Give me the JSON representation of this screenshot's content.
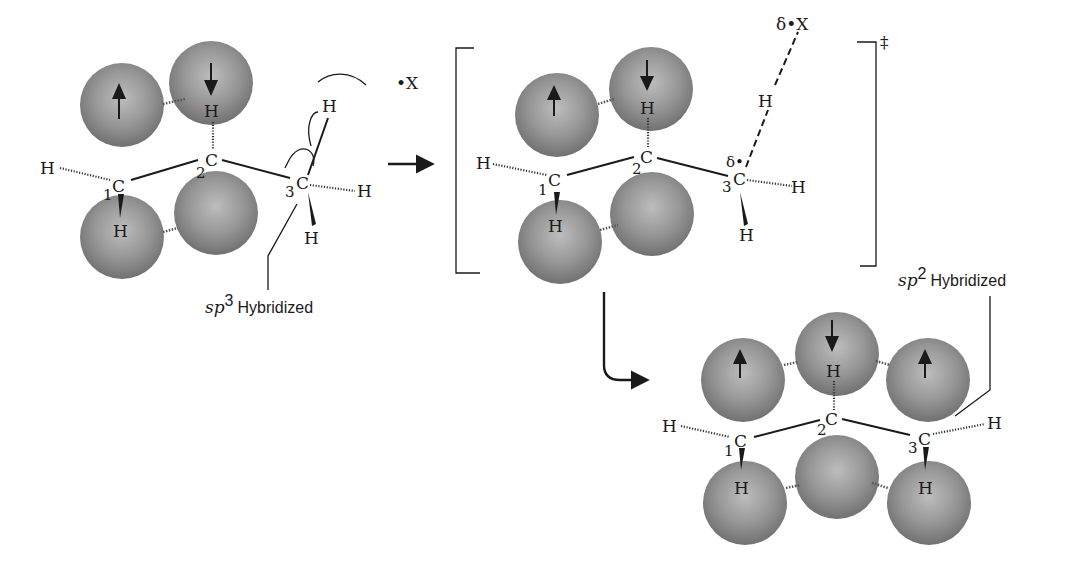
{
  "diagram": {
    "colors": {
      "sphere_light": "#bdbdbd",
      "sphere_mid": "#8f8f8f",
      "sphere_dark": "#6e6e6e",
      "ink": "#1a1a1a",
      "background": "#ffffff"
    },
    "reactant": {
      "carbons": [
        {
          "symbol": "C",
          "number": "1"
        },
        {
          "symbol": "C",
          "number": "2"
        },
        {
          "symbol": "C",
          "number": "3"
        }
      ],
      "hydrogens": [
        "H",
        "H",
        "H",
        "H",
        "H",
        "H"
      ],
      "spin_up": "↑",
      "spin_down": "↓",
      "radical": "•X",
      "hybridization_label": {
        "prefix": "sp",
        "superscript": "3",
        "suffix": "Hybridized"
      }
    },
    "transition_state": {
      "carbons": [
        {
          "symbol": "C",
          "number": "1"
        },
        {
          "symbol": "C",
          "number": "2"
        },
        {
          "symbol": "C",
          "number": "3"
        }
      ],
      "hydrogens": [
        "H",
        "H",
        "H",
        "H",
        "H",
        "H"
      ],
      "partial_radical_carbon": "δ•",
      "partial_radical_x": "δ•X",
      "double_dagger": "‡"
    },
    "product": {
      "carbons": [
        {
          "symbol": "C",
          "number": "1"
        },
        {
          "symbol": "C",
          "number": "2"
        },
        {
          "symbol": "C",
          "number": "3"
        }
      ],
      "hydrogens": [
        "H",
        "H",
        "H",
        "H",
        "H"
      ],
      "hybridization_label": {
        "prefix": "sp",
        "superscript": "2",
        "suffix": "Hybridized"
      }
    }
  }
}
